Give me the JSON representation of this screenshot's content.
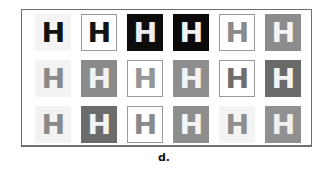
{
  "figure": {
    "caption": "d.",
    "glyph": "H",
    "rows": [
      [
        {
          "bg": "#f4f4f4",
          "fg": "#111111",
          "bordered": false
        },
        {
          "bg": "#ffffff",
          "fg": "#141414",
          "bordered": true
        },
        {
          "bg": "#0c0c0c",
          "fg": "#ececec",
          "bordered": false
        },
        {
          "bg": "#0a0a0a",
          "fg": "#f2f2f2",
          "bordered": false
        },
        {
          "bg": "#ffffff",
          "fg": "#8a8a8a",
          "bordered": true
        },
        {
          "bg": "#8c8c8c",
          "fg": "#f4f4f4",
          "bordered": false
        }
      ],
      [
        {
          "bg": "#f3f3f3",
          "fg": "#8a8a8a",
          "bordered": false
        },
        {
          "bg": "#8a8a8a",
          "fg": "#f2f2f2",
          "bordered": false
        },
        {
          "bg": "#ffffff",
          "fg": "#969696",
          "bordered": true
        },
        {
          "bg": "#8e8e8e",
          "fg": "#f4f4f4",
          "bordered": false
        },
        {
          "bg": "#ffffff",
          "fg": "#6e6e6e",
          "bordered": true
        },
        {
          "bg": "#6a6a6a",
          "fg": "#f4f4f4",
          "bordered": false
        }
      ],
      [
        {
          "bg": "#f3f3f3",
          "fg": "#8a8a8a",
          "bordered": false
        },
        {
          "bg": "#6c6c6c",
          "fg": "#f4f4f4",
          "bordered": false
        },
        {
          "bg": "#ffffff",
          "fg": "#8a8a8a",
          "bordered": true
        },
        {
          "bg": "#8e8e8e",
          "fg": "#f4f4f4",
          "bordered": false
        },
        {
          "bg": "#f4f4f4",
          "fg": "#8e8e8e",
          "bordered": false
        },
        {
          "bg": "#909090",
          "fg": "#f0f0f0",
          "bordered": false
        }
      ]
    ]
  }
}
